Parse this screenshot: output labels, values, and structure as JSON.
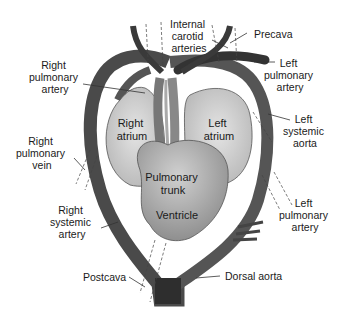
{
  "diagram": {
    "type": "anatomical-diagram",
    "colors": {
      "vessel_dark": "#3c3c3c",
      "vessel_mid": "#6e6e6e",
      "chamber_light": "#cfcfcf",
      "ventricle": "#a8a8a8",
      "background": "#ffffff"
    },
    "structures_inside": {
      "right_atrium": [
        "Right",
        "atrium"
      ],
      "left_atrium": [
        "Left",
        "atrium"
      ],
      "pulmonary_trunk": [
        "Pulmonary",
        "trunk"
      ],
      "ventricle": [
        "Ventricle"
      ]
    },
    "labels": {
      "internal_carotid": [
        "Internal",
        "carotid",
        "arteries"
      ],
      "precava": [
        "Precava"
      ],
      "left_pulmonary_artery_top": [
        "Left",
        "pulmonary",
        "artery"
      ],
      "right_pulmonary_artery": [
        "Right",
        "pulmonary",
        "artery"
      ],
      "left_systemic_aorta": [
        "Left",
        "systemic",
        "aorta"
      ],
      "right_pulmonary_vein": [
        "Right",
        "pulmonary",
        "vein"
      ],
      "right_systemic_artery": [
        "Right",
        "systemic",
        "artery"
      ],
      "left_pulmonary_artery_bottom": [
        "Left",
        "pulmonary",
        "artery"
      ],
      "postcava": [
        "Postcava"
      ],
      "dorsal_aorta": [
        "Dorsal aorta"
      ]
    }
  }
}
